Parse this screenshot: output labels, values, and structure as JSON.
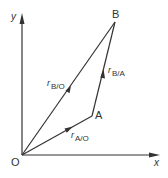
{
  "diagram": {
    "title": "",
    "axes": {
      "x_label": "x",
      "y_label": "y",
      "origin_label": "O"
    },
    "points": [
      {
        "id": "O",
        "label": "O"
      },
      {
        "id": "A",
        "label": "A"
      },
      {
        "id": "B",
        "label": "B"
      }
    ],
    "vectors": [
      {
        "id": "rAO",
        "symbol": "r",
        "subscript": "A/O",
        "from": "O",
        "to": "A"
      },
      {
        "id": "rBA",
        "symbol": "r",
        "subscript": "B/A",
        "from": "A",
        "to": "B"
      },
      {
        "id": "rBO",
        "symbol": "r",
        "subscript": "B/O",
        "from": "O",
        "to": "B"
      }
    ],
    "colors": {
      "line": "#333333",
      "background": "#ffffff"
    }
  }
}
